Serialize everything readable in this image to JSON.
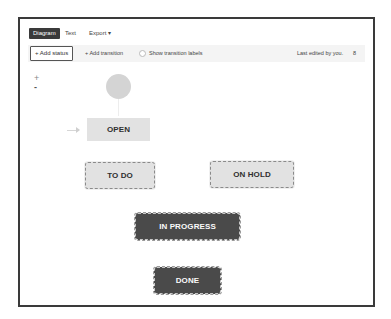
{
  "tabs": [
    {
      "label": "Diagram",
      "active": true
    },
    {
      "label": "Text",
      "active": false
    },
    {
      "label": "Export ▾",
      "active": false
    }
  ],
  "toolbar": {
    "add_status_label": "+ Add status",
    "add_transition_label": "+ Add transition",
    "show_transition_labels": "Show transition labels",
    "show_transition_labels_checked": false,
    "last_edited": "Last edited by you.",
    "people_icon_glyph": "8"
  },
  "zoom_controls": {
    "zoom_in": "+",
    "zoom_out": "-"
  },
  "diagram": {
    "start_node": "start-circle",
    "statuses": [
      {
        "id": "open",
        "label": "OPEN",
        "style": "light"
      },
      {
        "id": "todo",
        "label": "TO DO",
        "style": "light-dashed"
      },
      {
        "id": "onhold",
        "label": "ON HOLD",
        "style": "light-dashed"
      },
      {
        "id": "inprogress",
        "label": "IN PROGRESS",
        "style": "dark-dashed"
      },
      {
        "id": "done",
        "label": "DONE",
        "style": "dark-dashed"
      }
    ]
  },
  "colors": {
    "frame_border": "#3a3a3a",
    "active_tab_bg": "#3a3a3a",
    "light_node_bg": "#e2e2e2",
    "dark_node_bg": "#4a4a4a",
    "start_circle": "#d4d4d4",
    "toolbar_bg": "#f4f4f4"
  }
}
